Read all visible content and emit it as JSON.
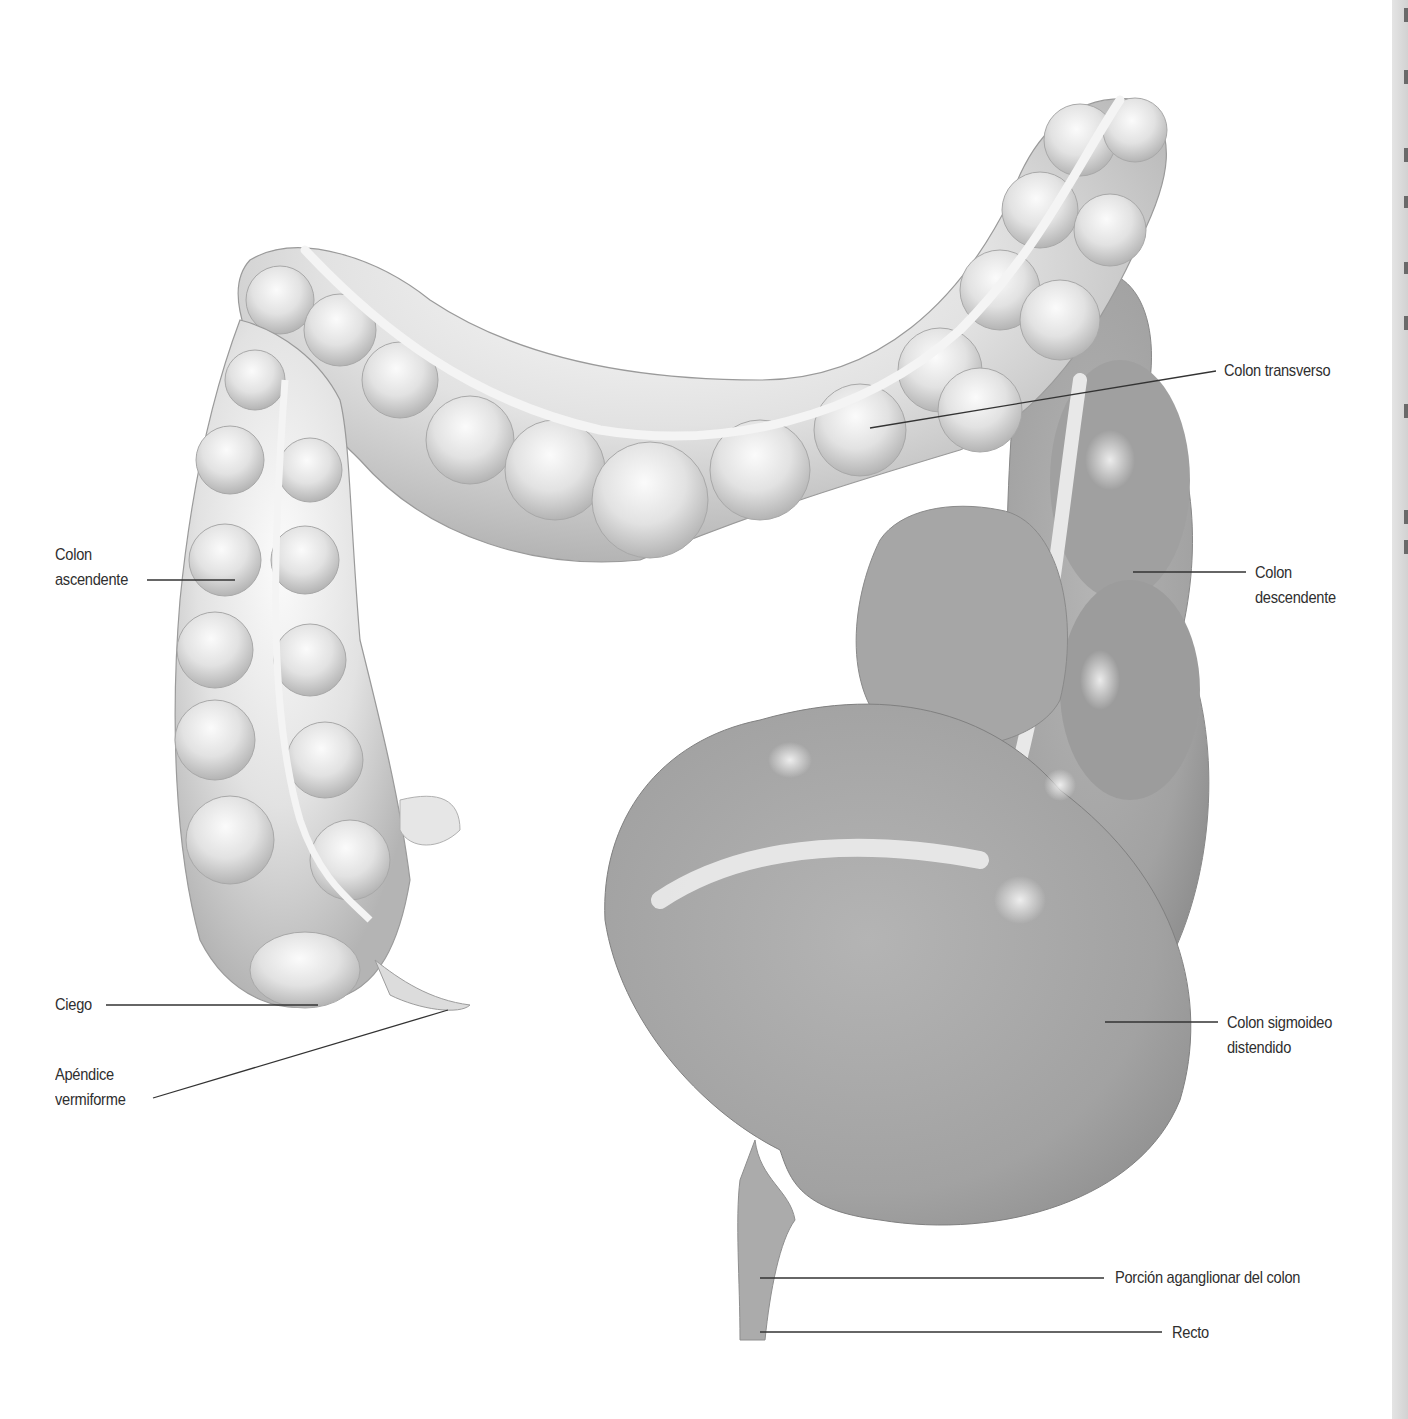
{
  "figure": {
    "colors": {
      "background": "#ffffff",
      "healthy_colon": "#e6e6e6",
      "distended_colon": "#a4a4a4",
      "mesentery_band": "#f2f2f2",
      "label_text": "#2f2f2f",
      "leader_line": "#333333"
    }
  },
  "labels": {
    "colon_transverso": {
      "line1": "Colon transverso"
    },
    "colon_ascendente": {
      "line1": "Colon",
      "line2": "ascendente"
    },
    "colon_descendente": {
      "line1": "Colon",
      "line2": "descendente"
    },
    "ciego": {
      "line1": "Ciego"
    },
    "apendice": {
      "line1": "Apéndice",
      "line2": "vermiforme"
    },
    "colon_sigmoideo": {
      "line1": "Colon sigmoideo",
      "line2": "distendido"
    },
    "porcion_aganglionar": {
      "line1": "Porción aganglionar del colon"
    },
    "recto": {
      "line1": "Recto"
    }
  }
}
